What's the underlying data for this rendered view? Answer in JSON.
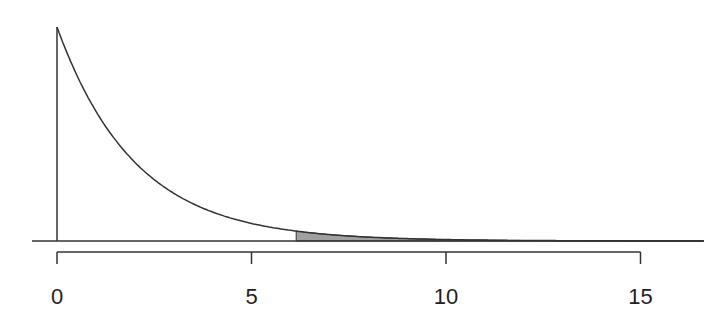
{
  "chart_data": {
    "type": "area",
    "title": "",
    "xlabel": "",
    "ylabel": "",
    "distribution": "exponential",
    "rate": 0.5,
    "shaded_from": 6.15,
    "xlim": [
      0,
      17
    ],
    "x_ticks": [
      0,
      5,
      10,
      15
    ],
    "x_tick_labels": [
      "0",
      "5",
      "10",
      "15"
    ],
    "y_axis_shown": false,
    "grid": false,
    "legend": null,
    "colors": {
      "line": "#333333",
      "shade": "#a0a0a0"
    },
    "sample_points": [
      {
        "x": 0,
        "y": 0.5
      },
      {
        "x": 1,
        "y": 0.303
      },
      {
        "x": 2,
        "y": 0.184
      },
      {
        "x": 3,
        "y": 0.112
      },
      {
        "x": 4,
        "y": 0.068
      },
      {
        "x": 5,
        "y": 0.041
      },
      {
        "x": 6,
        "y": 0.025
      },
      {
        "x": 8,
        "y": 0.009
      },
      {
        "x": 10,
        "y": 0.003
      },
      {
        "x": 15,
        "y": 0.0003
      }
    ]
  }
}
